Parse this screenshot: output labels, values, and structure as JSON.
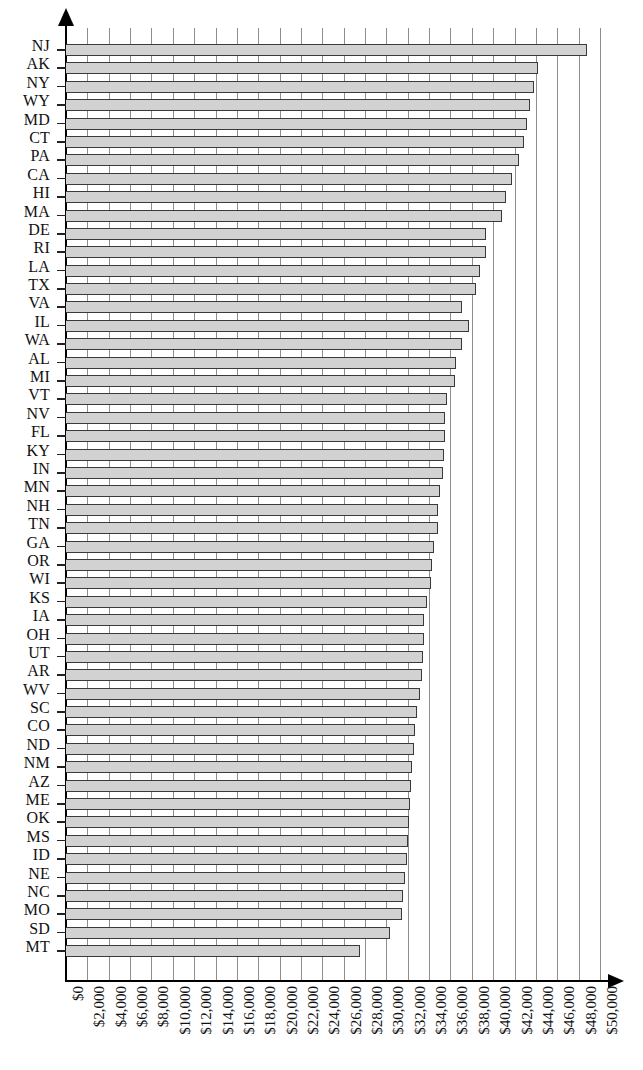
{
  "chart_data": {
    "type": "bar",
    "orientation": "horizontal",
    "title": "",
    "subtitle": "",
    "xlabel": "",
    "ylabel": "",
    "xlim": [
      0,
      50000
    ],
    "xtick_step": 2000,
    "grid": true,
    "legend": null,
    "bar_fill_color": "#d2d2d2",
    "bar_border_color": "#3a3a3a",
    "xticks": [
      "$0",
      "$2,000",
      "$4,000",
      "$6,000",
      "$8,000",
      "$10,000",
      "$12,000",
      "$14,000",
      "$16,000",
      "$18,000",
      "$20,000",
      "$22,000",
      "$24,000",
      "$26,000",
      "$28,000",
      "$30,000",
      "$32,000",
      "$34,000",
      "$36,000",
      "$38,000",
      "$40,000",
      "$42,000",
      "$44,000",
      "$46,000",
      "$48,000",
      "$50,000"
    ],
    "categories": [
      "NJ",
      "AK",
      "NY",
      "WY",
      "MD",
      "CT",
      "PA",
      "CA",
      "HI",
      "MA",
      "DE",
      "RI",
      "LA",
      "TX",
      "VA",
      "IL",
      "WA",
      "AL",
      "MI",
      "VT",
      "NV",
      "FL",
      "KY",
      "IN",
      "MN",
      "NH",
      "TN",
      "GA",
      "OR",
      "WI",
      "KS",
      "IA",
      "OH",
      "UT",
      "AR",
      "WV",
      "SC",
      "CO",
      "ND",
      "NM",
      "AZ",
      "ME",
      "OK",
      "MS",
      "ID",
      "NE",
      "NC",
      "MO",
      "SD",
      "MT"
    ],
    "values": [
      48800,
      44200,
      43800,
      43400,
      43200,
      42900,
      42400,
      41800,
      41200,
      40800,
      39300,
      39300,
      38800,
      38400,
      37100,
      37700,
      37100,
      36500,
      36400,
      35700,
      35500,
      35500,
      35400,
      35300,
      35000,
      34800,
      34800,
      34500,
      34300,
      34200,
      33800,
      33500,
      33500,
      33400,
      33300,
      33100,
      32900,
      32700,
      32600,
      32400,
      32300,
      32200,
      32100,
      32000,
      31900,
      31700,
      31600,
      31500,
      30300,
      27500
    ]
  }
}
